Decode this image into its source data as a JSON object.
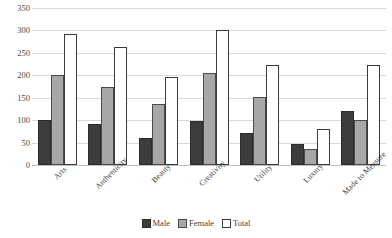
{
  "chart_data": {
    "type": "bar",
    "title": "",
    "xlabel": "",
    "ylabel": "",
    "ylim": [
      0,
      350
    ],
    "grid": true,
    "legend_position": "bottom",
    "categories": [
      "Arts",
      "Authenticity",
      "Beauty",
      "Creativity",
      "Utility",
      "Luxury",
      "Made to Measure"
    ],
    "y_ticks": [
      "0",
      "50",
      "100",
      "150",
      "200",
      "250",
      "300",
      "350"
    ],
    "y_tick_values": [
      0,
      50,
      100,
      150,
      200,
      250,
      300,
      350
    ],
    "series": [
      {
        "name": "Male",
        "color": "#3c3c3c",
        "values": [
          100,
          92,
          61,
          99,
          72,
          47,
          121
        ]
      },
      {
        "name": "Female",
        "color": "#a8a8a8",
        "values": [
          200,
          173,
          135,
          206,
          151,
          36,
          101
        ]
      },
      {
        "name": "Total",
        "color": "#ffffff",
        "values": [
          292,
          263,
          196,
          301,
          222,
          80,
          222
        ]
      }
    ]
  },
  "legend": {
    "items": [
      {
        "label": "Male",
        "swatch": "male"
      },
      {
        "label": "Female",
        "swatch": "female"
      },
      {
        "label": "Total",
        "swatch": "total"
      }
    ]
  }
}
